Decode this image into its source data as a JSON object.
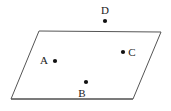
{
  "figure": {
    "type": "geometry-diagram",
    "canvas": {
      "width": 171,
      "height": 111,
      "background": "#ffffff"
    },
    "shape": {
      "name": "parallelogram",
      "stroke_color": "#555555",
      "stroke_width": 1,
      "bottom_edge_color": "#6b6b6b",
      "bottom_edge_width": 2,
      "vertices": [
        {
          "name": "top-left",
          "x": 39,
          "y": 31
        },
        {
          "name": "top-right",
          "x": 161,
          "y": 32
        },
        {
          "name": "bottom-right",
          "x": 133,
          "y": 99
        },
        {
          "name": "bottom-left",
          "x": 11,
          "y": 99
        }
      ],
      "path": "39,31 161,32 133,99 11,99"
    },
    "points": [
      {
        "id": "point-a",
        "label": "A",
        "dot": {
          "x": 55,
          "y": 61,
          "radius": 2.1,
          "color": "#111111"
        },
        "label_pos": {
          "x": 44,
          "y": 60
        },
        "label_placement": "left",
        "inside_shape": true
      },
      {
        "id": "point-b",
        "label": "B",
        "dot": {
          "x": 86,
          "y": 82,
          "radius": 2.1,
          "color": "#111111"
        },
        "label_pos": {
          "x": 82,
          "y": 93
        },
        "label_placement": "below-left",
        "inside_shape": true
      },
      {
        "id": "point-c",
        "label": "C",
        "dot": {
          "x": 123,
          "y": 52,
          "radius": 2.1,
          "color": "#111111"
        },
        "label_pos": {
          "x": 132,
          "y": 52
        },
        "label_placement": "right",
        "inside_shape": true
      },
      {
        "id": "point-d",
        "label": "D",
        "dot": {
          "x": 105,
          "y": 21,
          "radius": 2.1,
          "color": "#111111"
        },
        "label_pos": {
          "x": 105,
          "y": 10
        },
        "label_placement": "above",
        "inside_shape": false
      }
    ]
  }
}
